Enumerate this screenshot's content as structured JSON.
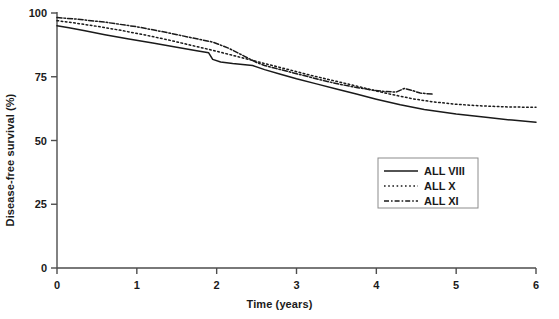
{
  "chart_data": {
    "type": "line",
    "title": "",
    "xlabel": "Time (years)",
    "ylabel": "Disease-free survival (%)",
    "xlim": [
      0,
      6
    ],
    "ylim": [
      0,
      100
    ],
    "xticks": [
      "0",
      "1",
      "2",
      "3",
      "4",
      "5",
      "6"
    ],
    "xtick_values": [
      0,
      1,
      2,
      3,
      4,
      5,
      6
    ],
    "yticks": [
      "0",
      "25",
      "50",
      "75",
      "100"
    ],
    "ytick_values": [
      0,
      25,
      50,
      75,
      100
    ],
    "grid": false,
    "legend_position": "center-right",
    "series": [
      {
        "name": "ALL VIII",
        "linestyle": "solid",
        "color": "#1a1a1a",
        "x": [
          0,
          0.15,
          0.35,
          0.6,
          0.9,
          1.2,
          1.5,
          1.75,
          1.9,
          1.95,
          2.05,
          2.2,
          2.45,
          2.6,
          2.8,
          3.0,
          3.25,
          3.5,
          3.75,
          4.0,
          4.3,
          4.6,
          5.0,
          5.4,
          5.7,
          6.0
        ],
        "y": [
          95.0,
          94.2,
          93.0,
          91.5,
          89.8,
          88.2,
          86.6,
          85.2,
          84.4,
          81.8,
          80.8,
          80.2,
          79.4,
          77.8,
          76.0,
          74.2,
          72.2,
          70.2,
          68.2,
          66.2,
          64.0,
          62.2,
          60.4,
          59.0,
          58.0,
          57.2
        ]
      },
      {
        "name": "ALL X",
        "linestyle": "dotted",
        "color": "#1a1a1a",
        "x": [
          0,
          0.2,
          0.5,
          0.8,
          1.1,
          1.4,
          1.7,
          2.0,
          2.3,
          2.6,
          2.9,
          3.2,
          3.5,
          3.8,
          4.0,
          4.2,
          4.45,
          4.7,
          5.0,
          5.3,
          5.6,
          6.0
        ],
        "y": [
          97.0,
          96.2,
          94.8,
          93.2,
          91.4,
          89.4,
          87.2,
          85.0,
          82.6,
          80.2,
          77.8,
          75.4,
          73.2,
          71.0,
          69.4,
          68.0,
          66.4,
          65.2,
          64.2,
          63.6,
          63.2,
          63.0
        ]
      },
      {
        "name": "ALL XI",
        "linestyle": "dashdot",
        "color": "#1a1a1a",
        "x": [
          0,
          0.25,
          0.6,
          1.0,
          1.4,
          1.7,
          1.95,
          2.15,
          2.35,
          2.5,
          2.6,
          2.75,
          2.95,
          3.15,
          3.35,
          3.55,
          3.75,
          3.95,
          4.1,
          4.25,
          4.35,
          4.45,
          4.55,
          4.7
        ],
        "y": [
          98.2,
          97.6,
          96.4,
          94.6,
          92.2,
          90.2,
          88.6,
          86.2,
          83.0,
          80.6,
          79.4,
          78.2,
          76.6,
          75.0,
          73.4,
          72.0,
          70.8,
          69.8,
          69.2,
          69.0,
          70.4,
          69.6,
          68.6,
          68.2
        ]
      }
    ]
  },
  "legend": {
    "items": [
      {
        "label": "ALL VIII",
        "style": "solid"
      },
      {
        "label": "ALL X",
        "style": "dotted"
      },
      {
        "label": "ALL XI",
        "style": "dashdot"
      }
    ]
  },
  "style": {
    "axis_color": "#4d4d4d",
    "line_color": "#1a1a1a",
    "text_color": "#1a1a1a",
    "background": "#ffffff",
    "legend_border": "#8c8c8c"
  }
}
